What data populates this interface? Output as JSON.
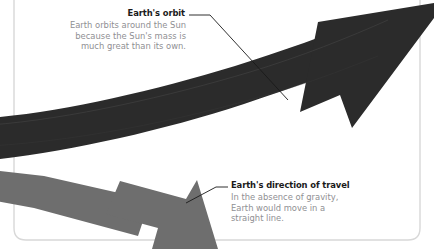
{
  "figure": {
    "background_color": "#ffffff",
    "frame_color": "#d8d8d8",
    "dark_arrow_color": "#2b2b2b",
    "gray_arrow_color": "#6e6e6e",
    "heading_color": "#1a1a1a",
    "body_text_color": "#8f8f93",
    "leader_line_color": "#1a1a1a"
  },
  "annotations": [
    {
      "id": "earths-orbit",
      "heading": "Earth's orbit",
      "body": "Earth orbits around the Sun\nbecause the Sun's mass is\nmuch great than its own.",
      "points_to": "dark-orbit-arrow"
    },
    {
      "id": "earths-direction-of-travel",
      "heading": "Earth's direction of travel",
      "body": "In the absence of gravity,\nEarth would move in a\nstraight line.",
      "points_to": "gray-direction-arrow"
    }
  ],
  "shapes": [
    {
      "id": "dark-orbit-arrow",
      "name": "orbit-arrow",
      "color": "#2b2b2b",
      "direction": "up-right"
    },
    {
      "id": "gray-direction-arrow",
      "name": "direction-of-travel-arrow",
      "color": "#6e6e6e",
      "direction": "down-right"
    }
  ]
}
